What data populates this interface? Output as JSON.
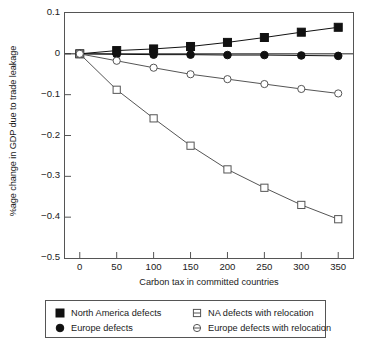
{
  "chart_data": {
    "type": "line",
    "title": "",
    "xlabel": "Carbon tax in committed countries",
    "ylabel": "%age change in GDP due to trade leakage",
    "x": [
      0,
      50,
      100,
      150,
      200,
      250,
      300,
      350
    ],
    "xtick_labels": [
      "0",
      "50",
      "100",
      "150",
      "200",
      "250",
      "300",
      "350"
    ],
    "ytick_labels": [
      "0.1",
      "0",
      "−0.1",
      "−0.2",
      "−0.3",
      "−0.4",
      "−0.5"
    ],
    "ytick_values": [
      0.1,
      0,
      -0.1,
      -0.2,
      -0.3,
      -0.4,
      -0.5
    ],
    "xlim": [
      -20,
      370
    ],
    "ylim": [
      -0.5,
      0.1
    ],
    "grid": false,
    "legend_position": "below-plot",
    "series": [
      {
        "name": "North America defects",
        "marker": "filled-square",
        "color": "#111111",
        "values": [
          0,
          0.008,
          0.012,
          0.018,
          0.028,
          0.04,
          0.053,
          0.065
        ]
      },
      {
        "name": "Europe defects",
        "marker": "filled-circle",
        "color": "#111111",
        "values": [
          0,
          -0.001,
          -0.002,
          -0.002,
          -0.003,
          -0.003,
          -0.004,
          -0.005
        ]
      },
      {
        "name": "NA defects with relocation",
        "marker": "open-square",
        "color": "#555555",
        "values": [
          0,
          -0.088,
          -0.158,
          -0.225,
          -0.283,
          -0.328,
          -0.37,
          -0.405
        ]
      },
      {
        "name": "Europe defects with relocation",
        "marker": "open-circle",
        "color": "#555555",
        "values": [
          0,
          -0.017,
          -0.034,
          -0.05,
          -0.062,
          -0.074,
          -0.086,
          -0.097
        ]
      }
    ]
  },
  "legend": {
    "entries": [
      {
        "label": "North America defects",
        "marker": "filled-square"
      },
      {
        "label": "Europe defects",
        "marker": "filled-circle"
      },
      {
        "label": "NA defects with relocation",
        "marker": "open-square"
      },
      {
        "label": "Europe defects with relocation",
        "marker": "open-circle"
      }
    ]
  }
}
